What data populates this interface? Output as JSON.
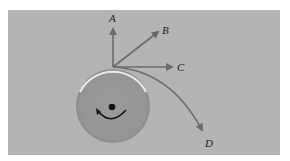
{
  "diagram": {
    "title": "",
    "background_color": "#b4b4b4",
    "wheel": {
      "fill": "#979797",
      "rim_highlight": "#e8e8e8",
      "center_dot": "#111111",
      "rotation": "clockwise",
      "rotation_arrow_icon": "clockwise-arc-arrow"
    },
    "arrow_color": "#6a6a6a",
    "arrows": [
      {
        "label": "A",
        "direction": "up (radial)"
      },
      {
        "label": "B",
        "direction": "up-right diagonal"
      },
      {
        "label": "C",
        "direction": "right (tangent)"
      },
      {
        "label": "D",
        "direction": "curved down-right"
      }
    ],
    "labels": {
      "a": "A",
      "b": "B",
      "c": "C",
      "d": "D"
    }
  }
}
